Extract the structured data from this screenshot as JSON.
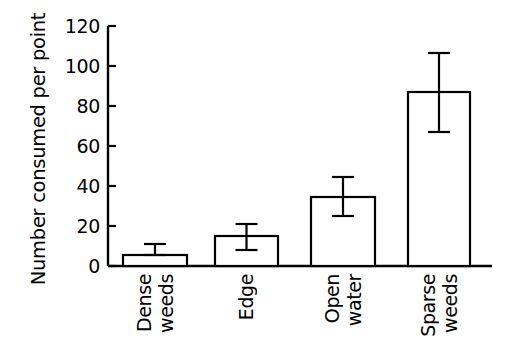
{
  "chart_data": {
    "type": "bar",
    "title": "",
    "subtitle": "",
    "xlabel": "",
    "ylabel": "Number consumed per point",
    "ylim": [
      0,
      120
    ],
    "yticks": [
      0,
      20,
      40,
      60,
      80,
      100,
      120
    ],
    "grid": false,
    "legend": null,
    "error_bars": "shown as vertical whiskers with caps",
    "categories": [
      "Dense weeds",
      "Edge",
      "Open water",
      "Sparse weeds"
    ],
    "category_lines": [
      [
        "Dense",
        "weeds"
      ],
      [
        "Edge"
      ],
      [
        "Open",
        "water"
      ],
      [
        "Sparse",
        "weeds"
      ]
    ],
    "values": [
      5.5,
      15,
      34.5,
      87
    ],
    "error_low": [
      5.5,
      8,
      25,
      67
    ],
    "error_high": [
      11,
      21,
      44.5,
      106.5
    ],
    "bar_fill": "#ffffff",
    "bar_edge": "#000000",
    "axis_color": "#000000",
    "background": "#ffffff"
  },
  "axis": {
    "tick_labels": [
      "120",
      "100",
      "80",
      "60",
      "40",
      "20",
      "0"
    ]
  }
}
